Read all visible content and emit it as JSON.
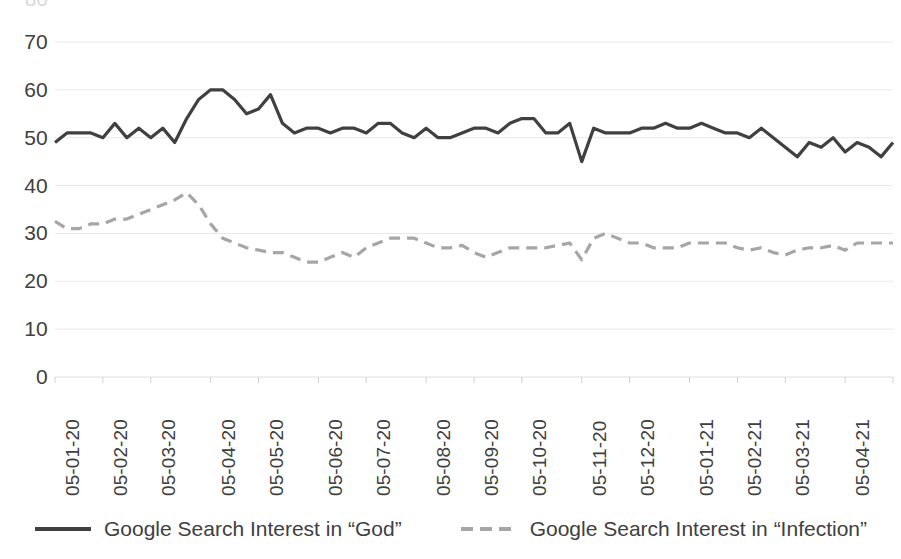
{
  "chart_data": {
    "type": "line",
    "title": "",
    "xlabel": "",
    "ylabel": "",
    "ylim": [
      0,
      70
    ],
    "y_ticks": [
      0,
      10,
      20,
      30,
      40,
      50,
      60,
      70
    ],
    "y_tick_labels": [
      "0",
      "10",
      "20",
      "30",
      "40",
      "50",
      "60",
      "70"
    ],
    "clipped_top_tick_label": "80",
    "grid": true,
    "grid_axis": "y",
    "legend_position": "bottom",
    "x_tick_labels": [
      "05-01-20",
      "05-02-20",
      "05-03-20",
      "05-04-20",
      "05-05-20",
      "05-06-20",
      "05-07-20",
      "05-08-20",
      "05-09-20",
      "05-10-20",
      "05-11-20",
      "05-12-20",
      "05-01-21",
      "05-02-21",
      "05-03-21",
      "05-04-21",
      "05-05-21"
    ],
    "x_tick_indices": [
      0,
      4,
      8,
      13,
      17,
      22,
      26,
      31,
      35,
      39,
      44,
      48,
      53,
      57,
      61,
      66,
      70
    ],
    "n_points": 71,
    "series": [
      {
        "name": "Google Search Interest in “God”",
        "style": "solid",
        "color": "#404040",
        "width": 3.2,
        "values": [
          49,
          51,
          51,
          51,
          50,
          53,
          50,
          52,
          50,
          52,
          49,
          54,
          58,
          60,
          60,
          58,
          55,
          56,
          59,
          53,
          51,
          52,
          52,
          51,
          52,
          52,
          51,
          53,
          53,
          51,
          50,
          52,
          50,
          50,
          51,
          52,
          52,
          51,
          53,
          54,
          54,
          51,
          51,
          53,
          45,
          52,
          51,
          51,
          51,
          52,
          52,
          53,
          52,
          52,
          53,
          52,
          51,
          51,
          50,
          52,
          50,
          48,
          46,
          49,
          48,
          50,
          47,
          49,
          48,
          46,
          49
        ]
      },
      {
        "name": "Google Search Interest in “Infection”",
        "style": "dashed",
        "color": "#a6a6a6",
        "width": 3.2,
        "values": [
          32.5,
          31,
          31,
          32,
          32,
          33,
          33,
          34,
          35,
          36,
          37,
          38.5,
          36,
          32,
          29,
          28,
          27,
          26.5,
          26,
          26,
          25,
          24,
          24,
          25,
          26,
          25,
          27,
          28,
          29,
          29,
          29,
          28,
          27,
          27,
          27.5,
          26,
          25,
          26,
          27,
          27,
          27,
          27,
          27.5,
          28,
          24.5,
          29,
          30,
          29,
          28,
          28,
          27,
          27,
          27,
          28,
          28,
          28,
          28,
          27,
          26.5,
          27,
          26,
          25.5,
          26.5,
          27,
          27,
          27.5,
          26.5,
          28,
          28,
          28,
          28
        ]
      }
    ]
  },
  "legend": {
    "items": [
      {
        "label": "Google Search Interest in “God”",
        "style": "solid",
        "color": "#404040"
      },
      {
        "label": "Google Search Interest in “Infection”",
        "style": "dashed",
        "color": "#a6a6a6"
      }
    ]
  },
  "colors": {
    "god_line": "#404040",
    "infection_line": "#a6a6a6",
    "grid": "#e8e8e8",
    "text": "#404040",
    "background": "#ffffff"
  }
}
